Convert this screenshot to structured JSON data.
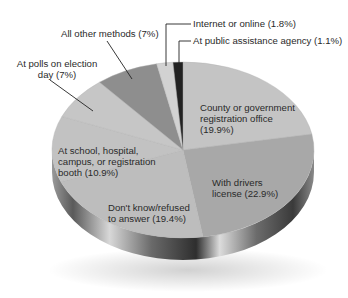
{
  "chart_data": {
    "type": "pie",
    "style": "3d",
    "title": "",
    "start_angle": "12 o'clock",
    "direction": "clockwise",
    "slices": [
      {
        "label": "County or government registration office",
        "value": 19.9,
        "display": "County or government\nregistration office\n(19.9%)",
        "color": "#c4c4c4"
      },
      {
        "label": "With drivers license",
        "value": 22.9,
        "display": "With drivers\nlicense (22.9%)",
        "color": "#a8a8a8"
      },
      {
        "label": "Don't know/refused to answer",
        "value": 19.4,
        "display": "Don't know/refused\nto answer (19.4%)",
        "color": "#bdbdbd"
      },
      {
        "label": "At school, hospital, campus, or registration booth",
        "value": 10.9,
        "display": "At school, hospital,\ncampus, or registration\nbooth (10.9%)",
        "color": "#c2c2c2"
      },
      {
        "label": "At polls on election day",
        "value": 7,
        "display": "At polls on election\nday (7%)",
        "color": "#c6c6c6"
      },
      {
        "label": "All other methods",
        "value": 7,
        "display": "All other methods (7%)",
        "color": "#8e8e8e"
      },
      {
        "label": "Internet or online",
        "value": 1.8,
        "display": "Internet or online (1.8%)",
        "color": "#d2d2d2"
      },
      {
        "label": "At public assistance agency",
        "value": 1.1,
        "display": "At public assistance agency (1.1%)",
        "color": "#222222"
      }
    ],
    "legend": "none (callout labels)"
  },
  "labels": {
    "county": [
      "County or government",
      "registration office",
      "(19.9%)"
    ],
    "drivers": [
      "With drivers",
      "license (22.9%)"
    ],
    "dontknow": [
      "Don't know/refused",
      "to answer (19.4%)"
    ],
    "school": [
      "At school, hospital,",
      "campus, or registration",
      "booth (10.9%)"
    ],
    "polls": [
      "At polls on election",
      "day (7%)"
    ],
    "other": "All other methods (7%)",
    "internet": "Internet or online (1.8%)",
    "publicassist": "At public assistance agency (1.1%)"
  }
}
